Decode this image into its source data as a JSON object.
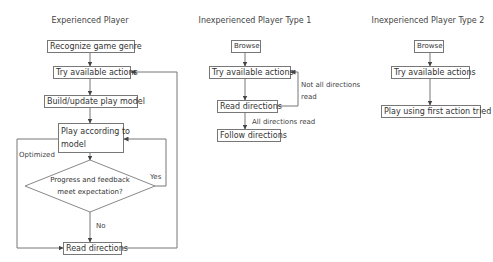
{
  "diagram": {
    "type": "flowchart",
    "columns": [
      {
        "title": "Experienced Player",
        "nodes": {
          "recognize": "Recognize game genre",
          "try": "Try available actions",
          "build": "Build/update play model",
          "play_line1": "Play according to",
          "play_line2": "model",
          "decision_line1": "Progress and feedback",
          "decision_line2": "meet expectation?",
          "read": "Read directions"
        },
        "edge_labels": {
          "optimized": "Optimized",
          "yes": "Yes",
          "no": "No"
        }
      },
      {
        "title": "Inexperienced Player Type 1",
        "nodes": {
          "browse": "Browse",
          "try": "Try available actions",
          "read": "Read directions",
          "follow": "Follow directions"
        },
        "edge_labels": {
          "not_all_line1": "Not all directions",
          "not_all_line2": "read",
          "all_read": "All directions read"
        }
      },
      {
        "title": "Inexperienced Player Type 2",
        "nodes": {
          "browse": "Browse",
          "try": "Try available actions",
          "play_first": "Play using first action tried"
        }
      }
    ],
    "colors": {
      "line": "#777777",
      "text": "#333333",
      "background": "#ffffff"
    }
  }
}
